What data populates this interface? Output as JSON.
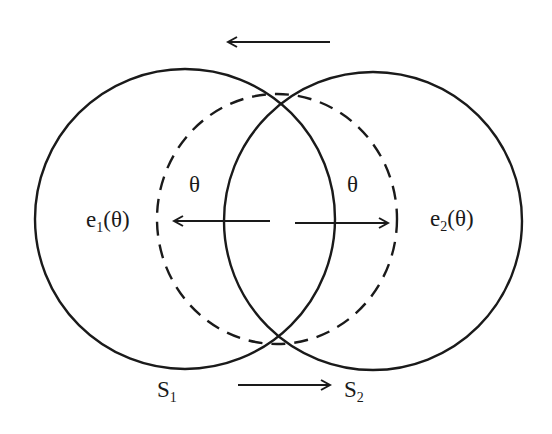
{
  "diagram": {
    "colors": {
      "stroke": "#1a1a1a",
      "background": "#ffffff"
    },
    "circles": [
      {
        "id": "S1",
        "style": "solid",
        "cx": 185,
        "cy": 219,
        "r": 150
      },
      {
        "id": "S2",
        "style": "solid",
        "cx": 373,
        "cy": 221,
        "r": 149
      },
      {
        "id": "dashed",
        "style": "dashed",
        "cx": 277,
        "cy": 219,
        "rx": 120,
        "ry": 125
      }
    ],
    "arrows": [
      {
        "id": "top-arrow",
        "direction": "left",
        "x1": 330,
        "y1": 42,
        "x2": 228,
        "y2": 42
      },
      {
        "id": "bottom-arrow",
        "direction": "right",
        "x1": 238,
        "y1": 385,
        "x2": 330,
        "y2": 385
      },
      {
        "id": "e1-arrow",
        "direction": "left",
        "x1": 270,
        "y1": 221,
        "x2": 174,
        "y2": 221
      },
      {
        "id": "e2-arrow",
        "direction": "right",
        "x1": 295,
        "y1": 223,
        "x2": 388,
        "y2": 223
      }
    ],
    "labels": {
      "theta_left": "θ",
      "theta_right": "θ",
      "e1": {
        "base": "e",
        "sub": "1",
        "arg": "(θ)"
      },
      "e2": {
        "base": "e",
        "sub": "2",
        "arg": "(θ)"
      },
      "s1": {
        "base": "S",
        "sub": "1"
      },
      "s2": {
        "base": "S",
        "sub": "2"
      }
    }
  }
}
